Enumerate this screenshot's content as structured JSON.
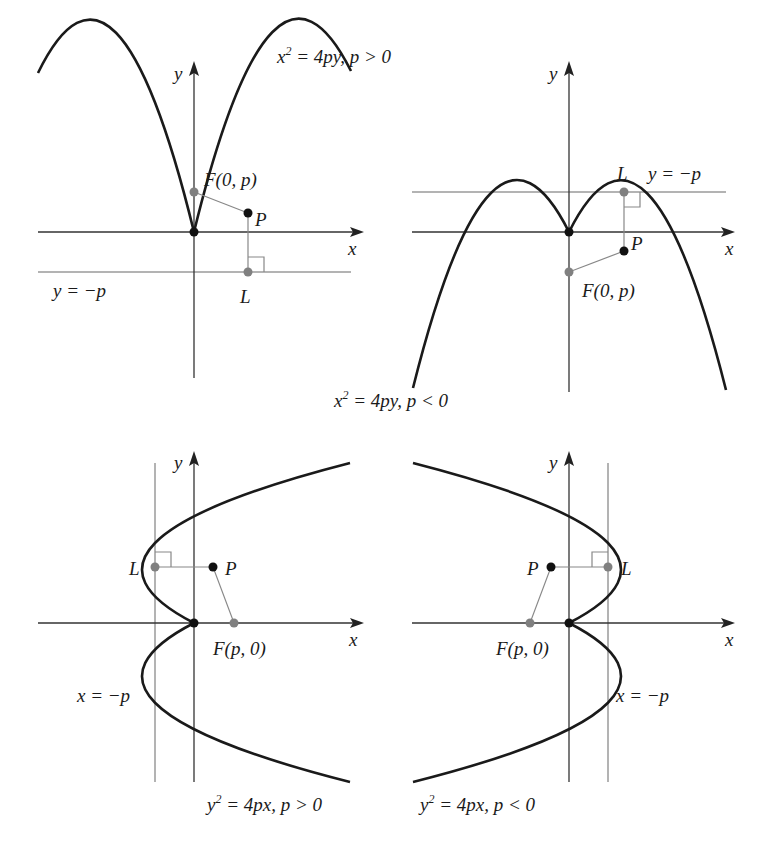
{
  "figure": {
    "colors": {
      "curve": "#1a1a1a",
      "axis": "#333333",
      "directrix": "#b3b3b3",
      "focus_dot": "#808080",
      "point_dot": "#111111",
      "segment": "#888888"
    },
    "panels": [
      {
        "id": "opens-up",
        "caption_lhs": "x",
        "caption_exp": "2",
        "caption_rhs": " = 4py, p > 0",
        "x_axis_label": "x",
        "y_axis_label": "y",
        "focus_label": "F(0, p)",
        "point_label": "P",
        "foot_label": "L",
        "directrix_label": "y = −p"
      },
      {
        "id": "opens-down",
        "caption_lhs": "x",
        "caption_exp": "2",
        "caption_rhs": " = 4py, p < 0",
        "x_axis_label": "x",
        "y_axis_label": "y",
        "focus_label": "F(0, p)",
        "point_label": "P",
        "foot_label": "L",
        "directrix_label": "y = −p"
      },
      {
        "id": "opens-right",
        "caption_lhs": "y",
        "caption_exp": "2",
        "caption_rhs": " = 4px, p > 0",
        "x_axis_label": "x",
        "y_axis_label": "y",
        "focus_label": "F(p, 0)",
        "point_label": "P",
        "foot_label": "L",
        "directrix_label": "x = −p"
      },
      {
        "id": "opens-left",
        "caption_lhs": "y",
        "caption_exp": "2",
        "caption_rhs": " = 4px, p < 0",
        "x_axis_label": "x",
        "y_axis_label": "y",
        "focus_label": "F(p, 0)",
        "point_label": "P",
        "foot_label": "L",
        "directrix_label": "x = −p"
      }
    ]
  }
}
